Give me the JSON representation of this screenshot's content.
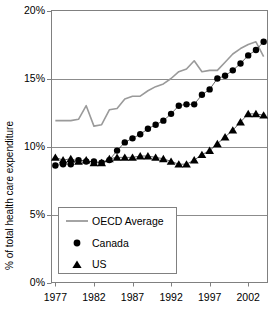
{
  "chart_data": {
    "type": "line",
    "title": "",
    "xlabel": "",
    "ylabel": "% of total health care expenditure",
    "xlim": [
      1976.5,
      2004.5
    ],
    "ylim": [
      0,
      20
    ],
    "yunit": "%",
    "grid": "horizontal",
    "legend_position": "lower-left-inside",
    "ytick_labels": [
      "0%",
      "5%",
      "10%",
      "15%",
      "20%"
    ],
    "ytick_values": [
      0,
      5,
      10,
      15,
      20
    ],
    "xtick_labels": [
      "1977",
      "1982",
      "1987",
      "1992",
      "1997",
      "2002"
    ],
    "xtick_values": [
      1977,
      1982,
      1987,
      1992,
      1997,
      2002
    ],
    "x": [
      1977,
      1978,
      1979,
      1980,
      1981,
      1982,
      1983,
      1984,
      1985,
      1986,
      1987,
      1988,
      1989,
      1990,
      1991,
      1992,
      1993,
      1994,
      1995,
      1996,
      1997,
      1998,
      1999,
      2000,
      2001,
      2002,
      2003,
      2004
    ],
    "series": [
      {
        "name": "OECD Average",
        "marker": "none",
        "color": "#9a9a9a",
        "line_width": 1.6,
        "values": [
          11.9,
          11.9,
          11.9,
          12.0,
          13.0,
          11.5,
          11.6,
          12.7,
          12.8,
          13.5,
          13.7,
          13.7,
          14.1,
          14.4,
          14.6,
          15.0,
          15.5,
          15.7,
          16.3,
          15.5,
          15.6,
          15.6,
          16.2,
          16.8,
          17.2,
          17.5,
          17.7,
          16.6
        ]
      },
      {
        "name": "Canada",
        "marker": "circle",
        "color": "#000000",
        "line_width": 0.6,
        "values": [
          8.6,
          8.7,
          8.7,
          9.0,
          8.9,
          8.9,
          8.8,
          9.0,
          9.7,
          10.3,
          10.6,
          10.9,
          11.3,
          11.6,
          11.9,
          12.4,
          13.0,
          13.1,
          13.1,
          13.8,
          14.2,
          15.0,
          15.2,
          15.6,
          16.1,
          16.7,
          17.1,
          17.7
        ]
      },
      {
        "name": "US",
        "marker": "triangle",
        "color": "#000000",
        "line_width": 0.6,
        "values": [
          9.2,
          9.0,
          9.1,
          8.9,
          9.0,
          8.8,
          8.8,
          9.1,
          9.2,
          9.2,
          9.2,
          9.3,
          9.3,
          9.2,
          9.1,
          8.9,
          8.7,
          8.7,
          9.0,
          9.4,
          9.7,
          10.2,
          10.7,
          11.2,
          11.8,
          12.4,
          12.4,
          12.3
        ]
      }
    ]
  },
  "axis": {
    "y_title": "% of total health care expenditure"
  },
  "legend": {
    "entries": [
      {
        "label": "OECD Average",
        "marker": "line"
      },
      {
        "label": "Canada",
        "marker": "circle"
      },
      {
        "label": "US",
        "marker": "triangle"
      }
    ]
  }
}
